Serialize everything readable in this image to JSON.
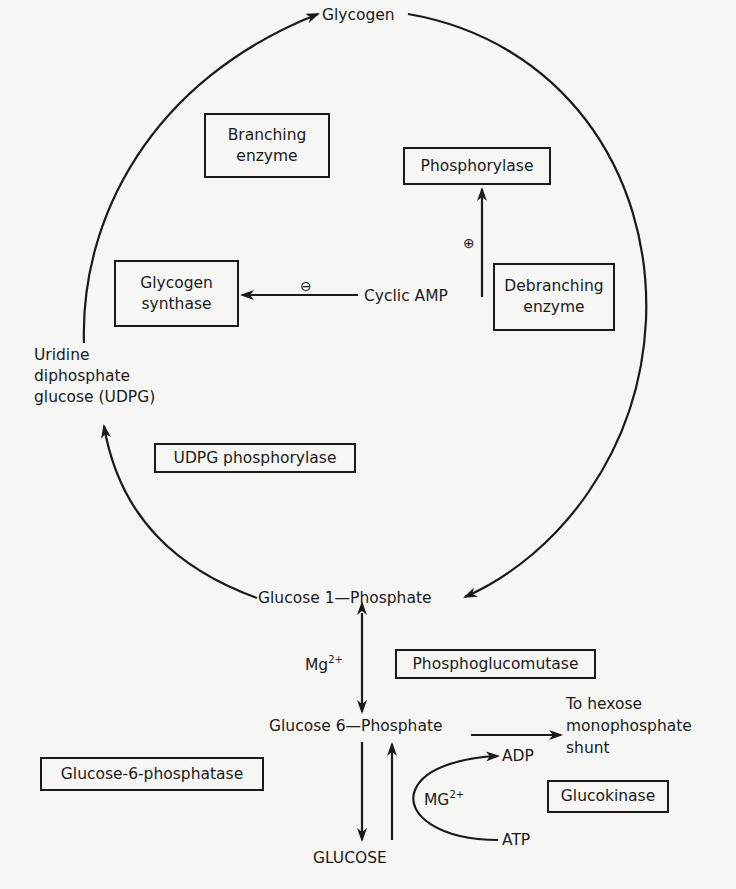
{
  "diagram": {
    "nodes": {
      "glycogen": "Glycogen",
      "udpg": [
        "Uridine",
        "diphosphate",
        "glucose (UDPG)"
      ],
      "glucose_1_phosphate": "Glucose 1—Phosphate",
      "glucose_6_phosphate": "Glucose 6—Phosphate",
      "glucose": "GLUCOSE",
      "cyclic_amp": "Cyclic AMP",
      "hmp_shunt": [
        "To hexose",
        "monophosphate",
        "shunt"
      ],
      "adp": "ADP",
      "atp": "ATP"
    },
    "enzymes": {
      "branching_enzyme": [
        "Branching",
        "enzyme"
      ],
      "phosphorylase": "Phosphorylase",
      "glycogen_synthase": [
        "Glycogen",
        "synthase"
      ],
      "debranching_enzyme": [
        "Debranching",
        "enzyme"
      ],
      "udpg_phosphorylase": "UDPG phosphorylase",
      "phosphoglucomutase": "Phosphoglucomutase",
      "glucose_6_phosphatase": "Glucose-6-phosphatase",
      "glucokinase": "Glucokinase"
    },
    "cofactors": {
      "mg_label": "Mg",
      "mg_charge": "2+",
      "MG_label": "MG",
      "MG_charge": "2+"
    },
    "regulation": {
      "inhibit_symbol": "⊖",
      "activate_symbol": "⊕"
    },
    "colors": {
      "ink": "#1a1a1a",
      "paper": "#f6f6f5"
    }
  }
}
